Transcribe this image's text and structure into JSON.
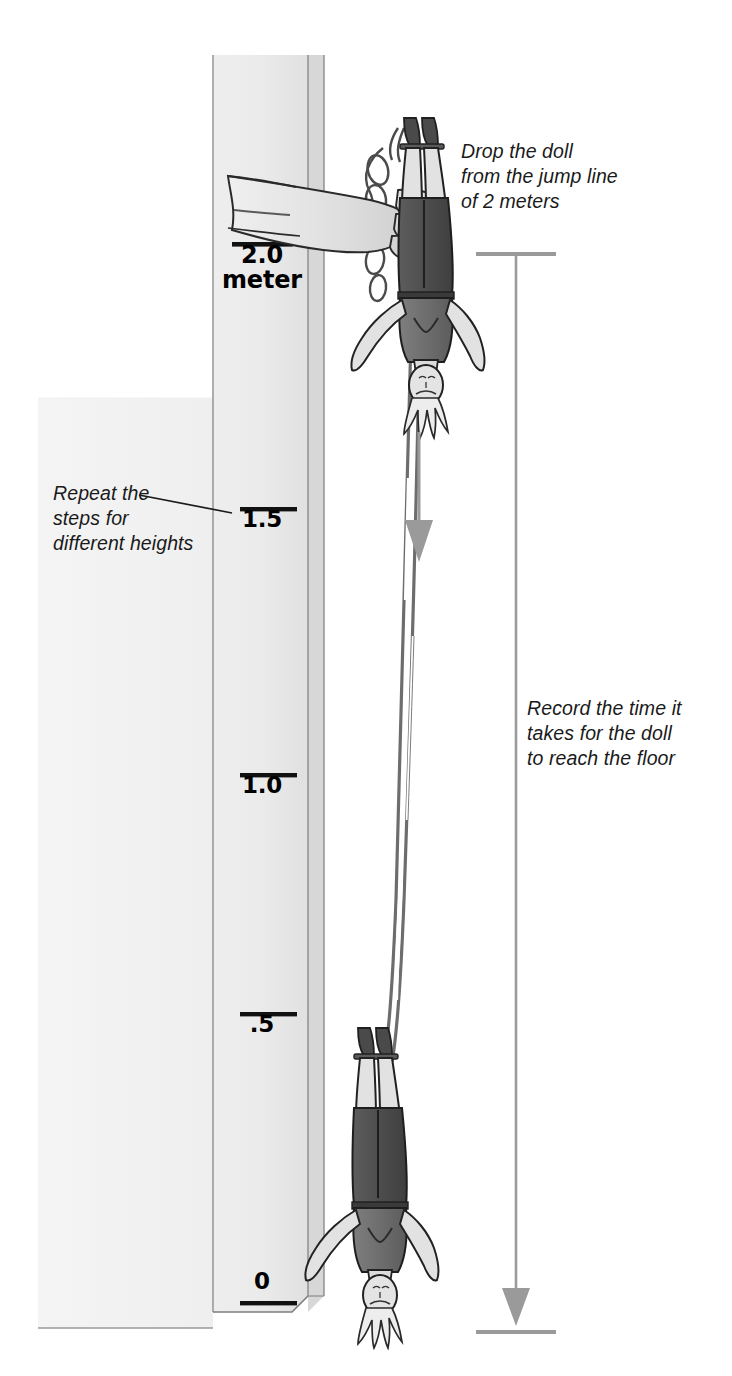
{
  "diagram": {
    "background_color": "#ffffff",
    "ink_color": "#1a1a1a",
    "wall_fill": "#f0f0f0",
    "column_fill": "#e9e9e9",
    "column_shade": "#d2d2d2",
    "arrow_color": "#9a9a9a",
    "doll_shirt_color": "#6f6f6f",
    "doll_pants_color": "#4f4f4f",
    "doll_skin_color": "#dedede"
  },
  "annotations": [
    {
      "id": "drop",
      "lines": "Drop the doll\nfrom the jump line\nof 2 meters"
    },
    {
      "id": "repeat",
      "lines": "Repeat the\nsteps for\ndifferent heights"
    },
    {
      "id": "record",
      "lines": "Record the time it\ntakes for the doll\nto reach the floor"
    }
  ],
  "ruler": {
    "unit_label": "meter",
    "ticks": [
      {
        "id": "t20",
        "value": "2.0",
        "label": "2.0\nmeter",
        "y": 238
      },
      {
        "id": "t15",
        "value": "1.5",
        "label": "1.5",
        "y": 503
      },
      {
        "id": "t10",
        "value": "1.0",
        "label": "1.0",
        "y": 769
      },
      {
        "id": "t05",
        "value": ".5",
        "label": ".5",
        "y": 1008
      },
      {
        "id": "t00",
        "value": "0",
        "label": "0",
        "y": 1303
      }
    ]
  },
  "measure": {
    "top_y": 255,
    "bottom_y": 1320,
    "x": 516,
    "caption": "fall distance arrow"
  },
  "fall_arrow": {
    "x": 418,
    "top_y": 430,
    "bottom_y": 545
  },
  "dolls": [
    {
      "id": "doll-top",
      "x": 418,
      "y": 120,
      "state": "held at jump line"
    },
    {
      "id": "doll-bottom",
      "x": 372,
      "y": 1010,
      "state": "near the floor"
    }
  ]
}
